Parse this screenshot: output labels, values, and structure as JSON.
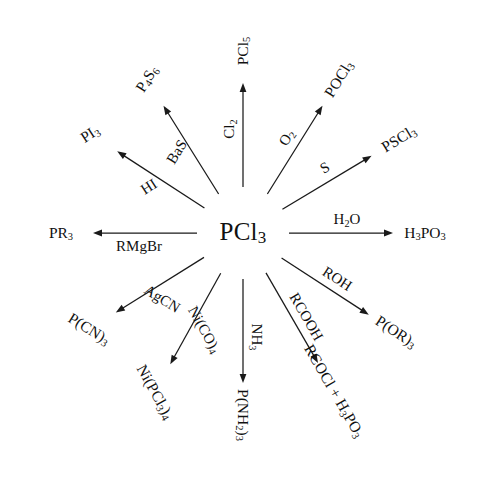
{
  "figure": {
    "type": "radial-reaction-diagram",
    "center": {
      "formula_html": "PCl<sub>3</sub>",
      "formula_text": "PCl3",
      "x": 243,
      "y": 233
    },
    "canvas": {
      "width": 484,
      "height": 503
    },
    "line_color": "#1a1a1a",
    "text_color": "#111111",
    "background": "#ffffff"
  },
  "chart_data": {
    "type": "diagram",
    "title": "",
    "center_species": "PCl3",
    "branch_count": 12,
    "branches": [
      {
        "reagent": "Cl2",
        "reagent_html": "Cl<sub>2</sub>",
        "product": "PCl5",
        "product_html": "PCl<sub>5</sub>",
        "angle_deg": -90,
        "label_rot": -90
      },
      {
        "reagent": "BaS",
        "reagent_html": "BaS",
        "product": "P4S6",
        "product_html": "P<sub>4</sub>S<sub>6</sub>",
        "angle_deg": -122,
        "label_rot": -58
      },
      {
        "reagent": "HI",
        "reagent_html": "HI",
        "product": "PI3",
        "product_html": "PI<sub>3</sub>",
        "angle_deg": -147,
        "label_rot": -33
      },
      {
        "reagent": "RMgBr",
        "reagent_html": "RMgBr",
        "product": "PR3",
        "product_html": "PR<sub>3</sub>",
        "angle_deg": 180,
        "label_rot": 0
      },
      {
        "reagent": "AgCN",
        "reagent_html": "AgCN",
        "product": "P(CN)3",
        "product_html": "P(CN)<sub>3</sub>",
        "angle_deg": 148,
        "label_rot": 32
      },
      {
        "reagent": "Ni(CO)4",
        "reagent_html": "Ni(CO)<sub>4</sub>",
        "product": "Ni(PCl3)4",
        "product_html": "Ni(PCl<sub>3</sub>)<sub>4</sub>",
        "angle_deg": 119,
        "label_rot": 61
      },
      {
        "reagent": "NH3",
        "reagent_html": "NH<sub>3</sub>",
        "product": "P(NH2)3",
        "product_html": "P(NH<sub>2</sub>)<sub>3</sub>",
        "angle_deg": 90,
        "label_rot": 90
      },
      {
        "reagent": "RCOOH",
        "reagent_html": "RCOOH",
        "product": "RCOCl + H3PO3",
        "product_html": "RCOCl + H<sub>3</sub>PO<sub>3</sub>",
        "angle_deg": 60,
        "label_rot": 60
      },
      {
        "reagent": "ROH",
        "reagent_html": "ROH",
        "product": "P(OR)3",
        "product_html": "P(OR)<sub>3</sub>",
        "angle_deg": 33,
        "label_rot": 33
      },
      {
        "reagent": "H2O",
        "reagent_html": "H<sub>2</sub>O",
        "product": "H3PO3",
        "product_html": "H<sub>3</sub>PO<sub>3</sub>",
        "angle_deg": 0,
        "label_rot": 0
      },
      {
        "reagent": "S",
        "reagent_html": "S",
        "product": "PSCl3",
        "product_html": "PSCl<sub>3</sub>",
        "angle_deg": -31,
        "label_rot": -31
      },
      {
        "reagent": "O2",
        "reagent_html": "O<sub>2</sub>",
        "product": "POCl3",
        "product_html": "POCl<sub>3</sub>",
        "angle_deg": -58,
        "label_rot": -58
      }
    ],
    "geometry": {
      "arrow_start_radius": 46,
      "arrow_end_radius": 150,
      "reagent_radius": 104,
      "product_radius": 182,
      "reagent_offset_px": 13
    }
  }
}
